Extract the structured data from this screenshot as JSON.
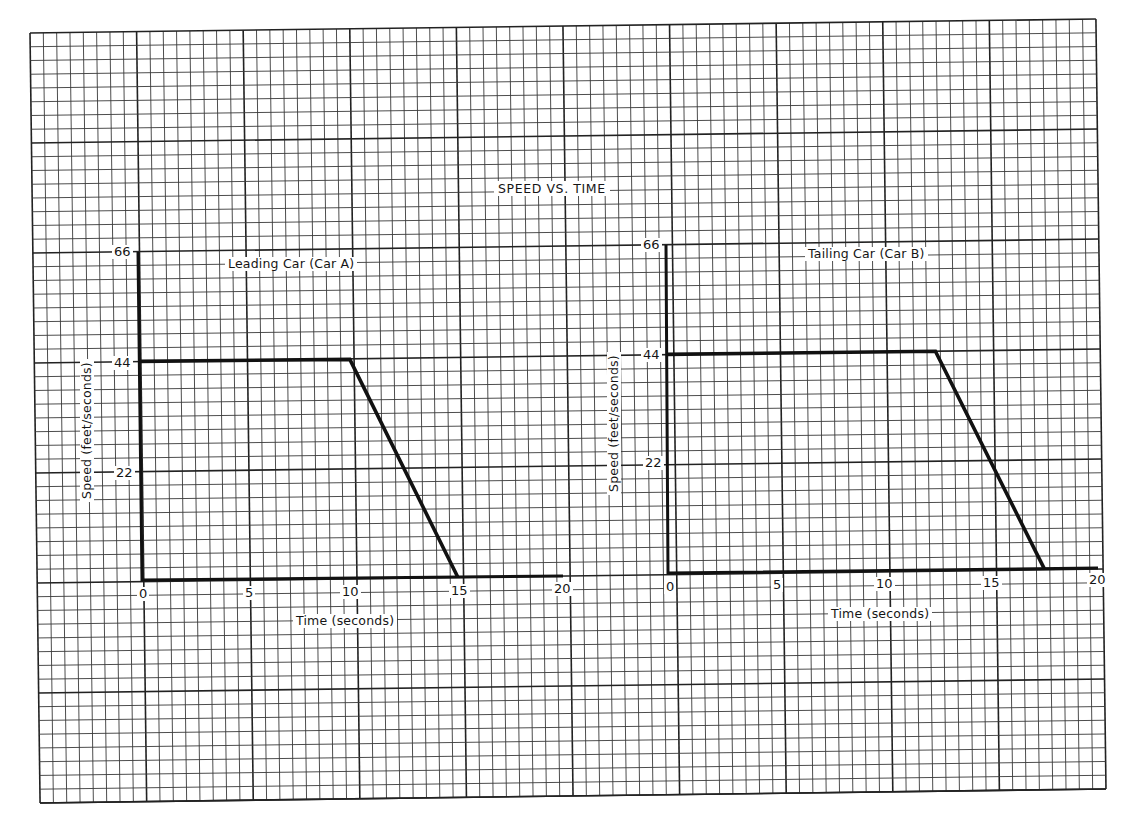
{
  "page": {
    "title": "SPEED VS. TIME",
    "colors": {
      "grid_line": "#3a3a3a",
      "major_line": "#222222",
      "data_line": "#111111",
      "paper": "#ffffff"
    }
  },
  "grid": {
    "minor_subdivisions": 8,
    "major_columns": 10,
    "major_rows": 7
  },
  "chart_data": [
    {
      "type": "line",
      "title": "Leading Car (Car A)",
      "xlabel": "Time (seconds)",
      "ylabel": "Speed (feet/seconds)",
      "x_ticks": [
        "0",
        "5",
        "10",
        "15",
        "20"
      ],
      "y_ticks": [
        "22",
        "44",
        "66"
      ],
      "xlim": [
        0,
        20
      ],
      "ylim": [
        0,
        66
      ],
      "grid": true,
      "series": [
        {
          "name": "Car A",
          "x": [
            0,
            10,
            15
          ],
          "y": [
            44,
            44,
            0
          ]
        }
      ]
    },
    {
      "type": "line",
      "title": "Tailing Car (Car B)",
      "xlabel": "Time (seconds)",
      "ylabel": "Speed (feet/seconds)",
      "x_ticks": [
        "0",
        "5",
        "10",
        "15",
        "20"
      ],
      "y_ticks": [
        "22",
        "44",
        "66"
      ],
      "xlim": [
        0,
        20
      ],
      "ylim": [
        0,
        66
      ],
      "grid": true,
      "series": [
        {
          "name": "Car B",
          "x": [
            0,
            12.5,
            17.5
          ],
          "y": [
            44,
            44,
            0
          ]
        }
      ]
    }
  ]
}
